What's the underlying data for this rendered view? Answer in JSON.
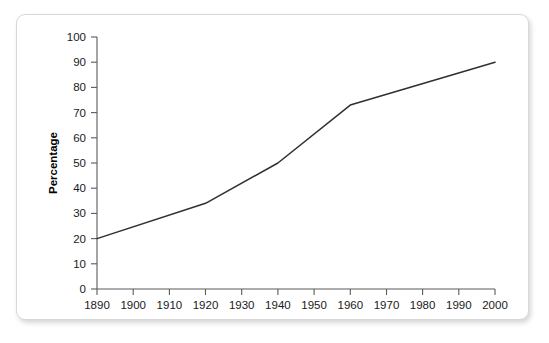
{
  "chart_data": {
    "type": "line",
    "title": "",
    "xlabel": "",
    "ylabel": "Percentage",
    "xlim": [
      1890,
      2000
    ],
    "ylim": [
      0,
      100
    ],
    "grid": false,
    "legend": null,
    "x_ticks": [
      1890,
      1900,
      1910,
      1920,
      1930,
      1940,
      1950,
      1960,
      1970,
      1980,
      1990,
      2000
    ],
    "y_ticks": [
      0,
      10,
      20,
      30,
      40,
      50,
      60,
      70,
      80,
      90,
      100
    ],
    "x": [
      1890,
      1920,
      1940,
      1960,
      2000
    ],
    "values": [
      20,
      34,
      50,
      73,
      90
    ],
    "series": [
      {
        "name": "Percentage",
        "color": "#2e2e36",
        "points": [
          {
            "x": 1890,
            "y": 20
          },
          {
            "x": 1920,
            "y": 34
          },
          {
            "x": 1940,
            "y": 50
          },
          {
            "x": 1960,
            "y": 73
          },
          {
            "x": 2000,
            "y": 90
          }
        ]
      }
    ]
  },
  "axes": {
    "y_title": "Percentage",
    "y_tick_labels": [
      "0",
      "10",
      "20",
      "30",
      "40",
      "50",
      "60",
      "70",
      "80",
      "90",
      "100"
    ],
    "x_tick_labels": [
      "1890",
      "1900",
      "1910",
      "1920",
      "1930",
      "1940",
      "1950",
      "1960",
      "1970",
      "1980",
      "1990",
      "2000"
    ]
  },
  "colors": {
    "line": "#2e2e36",
    "axis": "#5a5a5a",
    "border": "#d8d8d8",
    "background": "#ffffff",
    "text": "#1a1a1a"
  }
}
